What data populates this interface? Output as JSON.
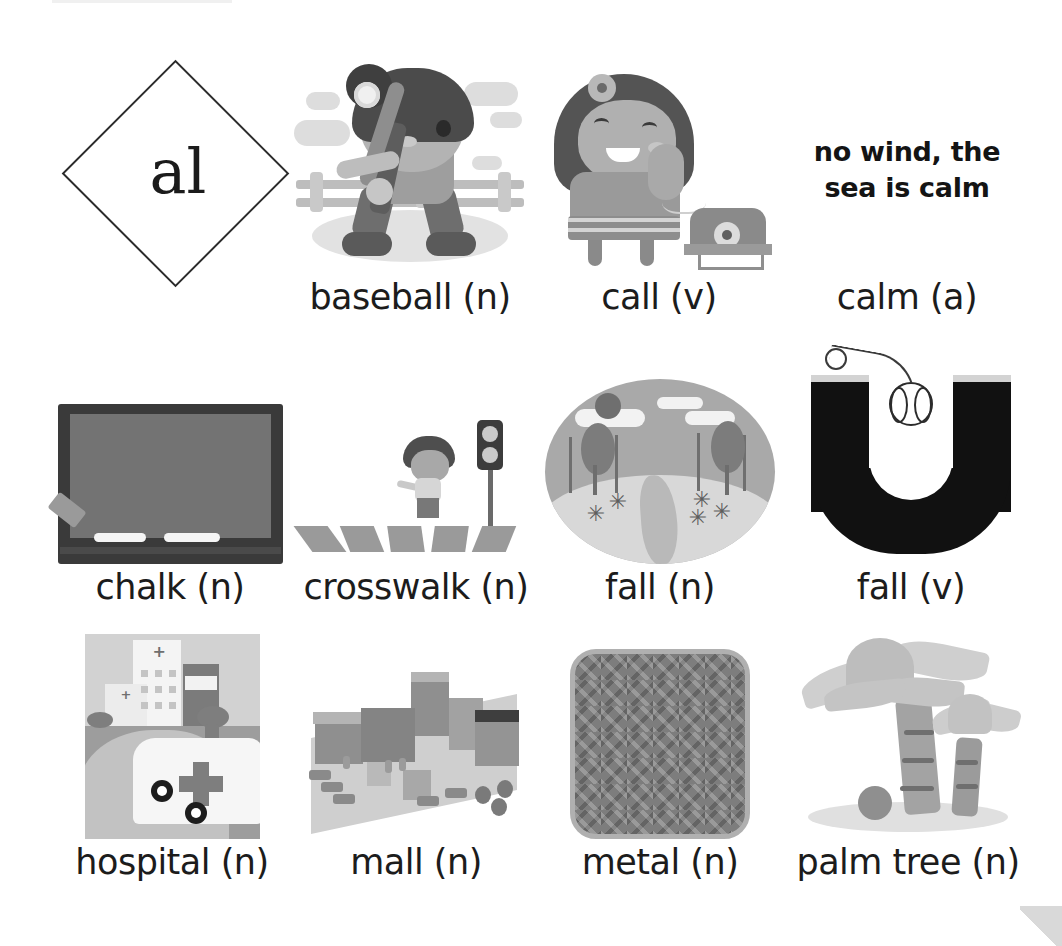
{
  "sheet": {
    "phonics_key": "al",
    "phrase": {
      "line1": "no wind, the",
      "line2": "sea is calm"
    }
  },
  "rows": [
    {
      "items": [
        {
          "id": "baseball",
          "label": "baseball (n)",
          "icon": "girl-batting-baseball-illustration"
        },
        {
          "id": "call",
          "label": "call (v)",
          "icon": "girl-on-telephone-illustration"
        },
        {
          "id": "calm",
          "label": "calm (a)",
          "icon": "text-phrase-no-wind-sea-is-calm"
        }
      ]
    },
    {
      "items": [
        {
          "id": "chalk",
          "label": "chalk (n)",
          "icon": "chalkboard-with-chalk-illustration"
        },
        {
          "id": "crosswalk",
          "label": "crosswalk (n)",
          "icon": "child-crossing-zebra-crossing-illustration"
        },
        {
          "id": "fall-n",
          "label": "fall (n)",
          "icon": "autumn-scene-oval-illustration"
        },
        {
          "id": "fall-v",
          "label": "fall (v)",
          "icon": "letter-u-with-falling-baseball-illustration"
        }
      ]
    },
    {
      "items": [
        {
          "id": "hospital",
          "label": "hospital (n)",
          "icon": "hospital-with-ambulance-illustration"
        },
        {
          "id": "mall",
          "label": "mall (n)",
          "icon": "shopping-mall-isometric-illustration"
        },
        {
          "id": "metal",
          "label": "metal (n)",
          "icon": "metal-herringbone-plate-illustration"
        },
        {
          "id": "palm-tree",
          "label": "palm tree (n)",
          "icon": "two-palm-trees-with-coconut-illustration"
        }
      ]
    }
  ],
  "colors": {
    "background": "#ffffff",
    "text": "#1c1c1c",
    "diamond_border": "#2b2b2b",
    "dark_fill": "#111111",
    "mid_gray": "#9a9a9a",
    "light_gray": "#d9d9d9"
  }
}
